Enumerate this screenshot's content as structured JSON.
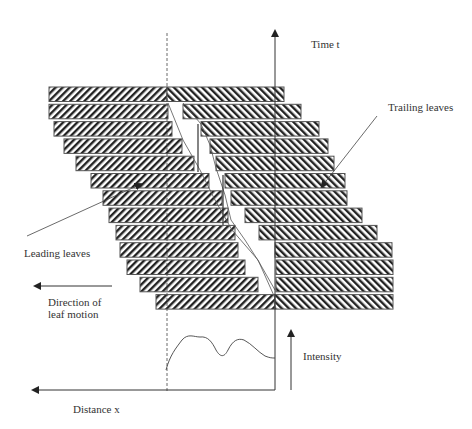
{
  "diagram": {
    "labels": {
      "time_axis": "Time t",
      "trailing_leaves": "Trailing leaves",
      "leading_leaves": "Leading leaves",
      "direction_line1": "Direction of",
      "direction_line2": "leaf motion",
      "intensity": "Intensity",
      "distance_axis": "Distance x"
    },
    "colors": {
      "stroke": "#333333",
      "hatch": "#222222",
      "background": "#ffffff"
    },
    "leaf_pairs": [
      {
        "row": 1,
        "leading": [
          49,
          167
        ],
        "trailing": [
          167,
          284
        ]
      },
      {
        "row": 2,
        "leading": [
          49,
          168
        ],
        "trailing": [
          183,
          301
        ]
      },
      {
        "row": 3,
        "leading": [
          54,
          172
        ],
        "trailing": [
          201,
          319
        ]
      },
      {
        "row": 4,
        "leading": [
          64,
          182
        ],
        "trailing": [
          210,
          328
        ]
      },
      {
        "row": 5,
        "leading": [
          76,
          194
        ],
        "trailing": [
          216,
          334
        ]
      },
      {
        "row": 6,
        "leading": [
          91,
          209
        ],
        "trailing": [
          225,
          345
        ]
      },
      {
        "row": 7,
        "leading": [
          103,
          222
        ],
        "trailing": [
          231,
          347
        ]
      },
      {
        "row": 8,
        "leading": [
          109,
          228
        ],
        "trailing": [
          245,
          362
        ]
      },
      {
        "row": 9,
        "leading": [
          116,
          235
        ],
        "trailing": [
          259,
          377
        ]
      },
      {
        "row": 10,
        "leading": [
          120,
          238
        ],
        "trailing": [
          275,
          392
        ]
      },
      {
        "row": 11,
        "leading": [
          127,
          245
        ],
        "trailing": [
          276,
          393
        ]
      },
      {
        "row": 12,
        "leading": [
          140,
          258
        ],
        "trailing": [
          276,
          393
        ]
      },
      {
        "row": 13,
        "leading": [
          156,
          275
        ],
        "trailing": [
          275,
          393
        ]
      }
    ]
  }
}
